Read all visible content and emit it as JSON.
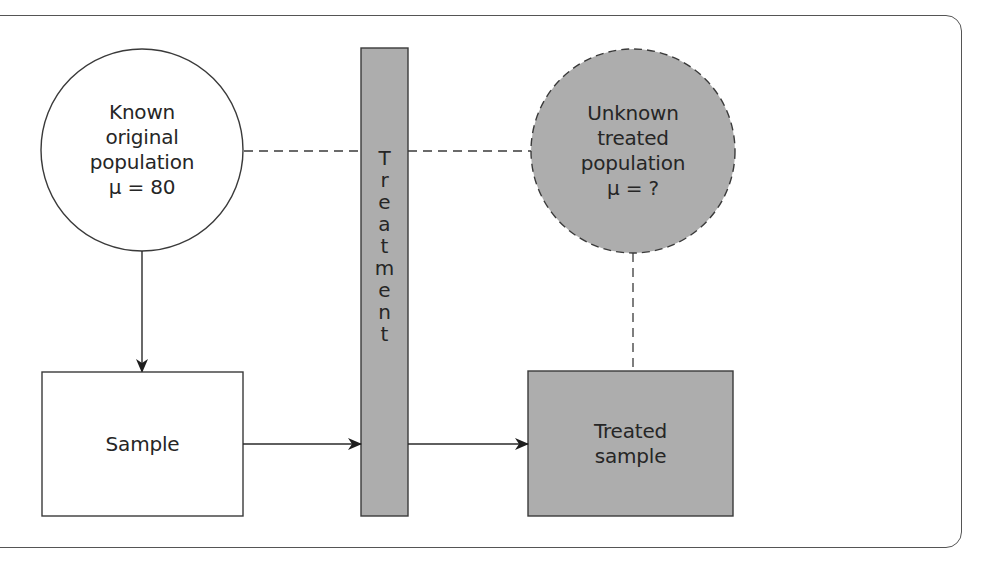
{
  "diagram": {
    "title": "",
    "nodes": {
      "known_population": {
        "shape": "circle",
        "style": "solid outline, white fill",
        "lines": [
          "Known",
          "original",
          "population",
          "μ = 80"
        ]
      },
      "unknown_population": {
        "shape": "circle",
        "style": "dashed outline, gray fill",
        "lines": [
          "Unknown",
          "treated",
          "population",
          "μ = ?"
        ]
      },
      "treatment": {
        "shape": "vertical bar",
        "style": "gray fill",
        "label": "Treatment",
        "letters": [
          "T",
          "r",
          "e",
          "a",
          "t",
          "m",
          "e",
          "n",
          "t"
        ]
      },
      "sample": {
        "shape": "rectangle",
        "style": "white fill",
        "label": "Sample"
      },
      "treated_sample": {
        "shape": "rectangle",
        "style": "gray fill",
        "lines": [
          "Treated",
          "sample"
        ]
      }
    },
    "edges": [
      {
        "from": "known_population",
        "to": "sample",
        "style": "solid",
        "arrow": true
      },
      {
        "from": "sample",
        "to": "treatment",
        "style": "solid",
        "arrow": true
      },
      {
        "from": "treatment",
        "to": "treated_sample",
        "style": "solid",
        "arrow": true
      },
      {
        "from": "known_population",
        "to": "unknown_population",
        "style": "dashed",
        "arrow": false,
        "through": "treatment"
      },
      {
        "from": "unknown_population",
        "to": "treated_sample",
        "style": "dashed",
        "arrow": false
      }
    ],
    "colors": {
      "stroke": "#3a3a3a",
      "gray_fill": "#adadad",
      "background": "#ffffff",
      "frame": "#555555"
    }
  }
}
